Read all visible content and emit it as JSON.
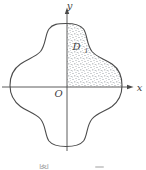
{
  "figure": {
    "type": "math-diagram",
    "labels": {
      "y_axis": "y",
      "x_axis": "x",
      "origin": "O",
      "region": "D",
      "region_subscript": "1"
    },
    "caption_partial": "图",
    "colors": {
      "line": "#4b4b4b",
      "label": "#3f3f3f",
      "stipple": "#8f969c",
      "background": "#ffffff"
    }
  }
}
